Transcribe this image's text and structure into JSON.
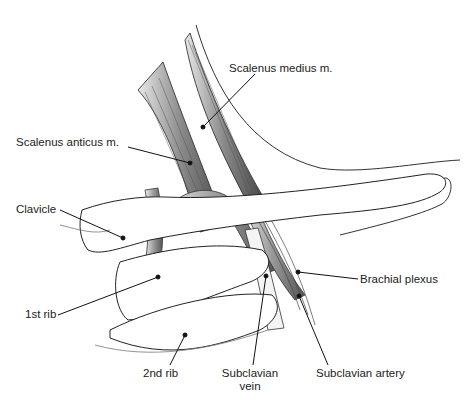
{
  "figure": {
    "labels": {
      "scalenus_medius": "Scalenus medius m.",
      "scalenus_anticus": "Scalenus anticus m.",
      "clavicle": "Clavicle",
      "brachial_plexus": "Brachial plexus",
      "first_rib": "1st rib",
      "second_rib": "2nd rib",
      "subclavian_vein_line1": "Subclavian",
      "subclavian_vein_line2": "vein",
      "subclavian_artery": "Subclavian artery"
    }
  }
}
